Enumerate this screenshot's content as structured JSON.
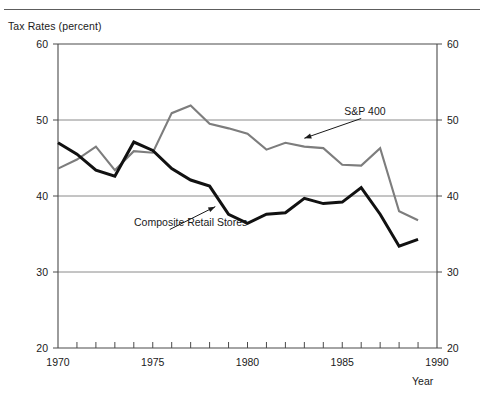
{
  "figure": {
    "y_axis_title": "Tax Rates (percent)",
    "x_axis_title": "Year"
  },
  "chart_data": {
    "type": "line",
    "title": "",
    "subtitle": "",
    "xlabel": "Year",
    "ylabel": "Tax Rates (percent)",
    "xlim": [
      1970,
      1990
    ],
    "ylim": [
      20,
      60
    ],
    "y_ticks": [
      20,
      30,
      40,
      50,
      60
    ],
    "y_tick_labels": [
      "20",
      "30",
      "40",
      "50",
      "60"
    ],
    "x_ticks": [
      1970,
      1971,
      1972,
      1973,
      1974,
      1975,
      1976,
      1977,
      1978,
      1979,
      1980,
      1981,
      1982,
      1983,
      1984,
      1985,
      1986,
      1987,
      1988,
      1989,
      1990
    ],
    "x_tick_labels_shown": [
      "1970",
      "1975",
      "1980",
      "1985",
      "1990"
    ],
    "x_labeled_ticks": [
      1970,
      1975,
      1980,
      1985,
      1990
    ],
    "grid": "horizontal",
    "grid_values": [
      30,
      40,
      50
    ],
    "legend_position": "inline-annotations",
    "dual_y_axis_mirrored": true,
    "x": [
      1970,
      1971,
      1972,
      1973,
      1974,
      1975,
      1976,
      1977,
      1978,
      1979,
      1980,
      1981,
      1982,
      1983,
      1984,
      1985,
      1986,
      1987,
      1988,
      1989
    ],
    "series": [
      {
        "name": "S&P 400",
        "color": "#7d7d7d",
        "linewidth": 2.1,
        "label_position": {
          "x": 1986.2,
          "y": 50.6
        },
        "values": [
          43.6,
          44.8,
          46.5,
          43.4,
          45.9,
          45.7,
          50.9,
          51.9,
          49.5,
          48.9,
          48.2,
          46.1,
          47.0,
          46.5,
          46.3,
          44.1,
          44.0,
          46.3,
          38.0,
          36.8
        ]
      },
      {
        "name": "Composite Retail Stores",
        "color": "#111111",
        "linewidth": 3.0,
        "label_position": {
          "x": 1977.0,
          "y": 36.1
        },
        "values": [
          47.0,
          45.5,
          43.4,
          42.6,
          47.1,
          46.0,
          43.6,
          42.1,
          41.3,
          37.6,
          36.4,
          37.6,
          37.8,
          39.7,
          39.0,
          39.2,
          41.1,
          37.6,
          33.4,
          34.3
        ]
      }
    ],
    "annotations": [
      {
        "text": "S&P 400",
        "arrow_from": [
          1986.0,
          50.2
        ],
        "arrow_to": [
          1983.0,
          47.6
        ]
      },
      {
        "text": "Composite Retail Stores",
        "arrow_from": [
          1975.9,
          35.6
        ],
        "arrow_to": [
          1978.3,
          38.6
        ]
      }
    ]
  }
}
